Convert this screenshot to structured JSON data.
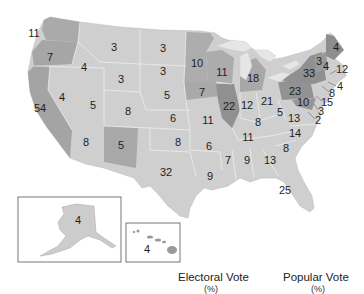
{
  "map": {
    "title": "",
    "colors": {
      "light": "#cfcfcf",
      "medium": "#a9a9a9",
      "dark": "#8f8f8f",
      "border": "#f2f2f2",
      "lakes": "#e6e6e6"
    },
    "states": [
      {
        "id": "WA",
        "value": "11",
        "x": 34,
        "y": 33,
        "shade": "medium"
      },
      {
        "id": "OR",
        "value": "7",
        "x": 50,
        "y": 57,
        "shade": "medium"
      },
      {
        "id": "CA",
        "value": "54",
        "x": 40,
        "y": 108,
        "shade": "medium"
      },
      {
        "id": "ID",
        "value": "4",
        "x": 84,
        "y": 67,
        "shade": "light"
      },
      {
        "id": "NV",
        "value": "4",
        "x": 62,
        "y": 97,
        "shade": "light"
      },
      {
        "id": "MT",
        "value": "3",
        "x": 114,
        "y": 47,
        "shade": "light"
      },
      {
        "id": "WY",
        "value": "3",
        "x": 121,
        "y": 79,
        "shade": "light"
      },
      {
        "id": "UT",
        "value": "5",
        "x": 93,
        "y": 105,
        "shade": "light"
      },
      {
        "id": "CO",
        "value": "8",
        "x": 128,
        "y": 111,
        "shade": "light"
      },
      {
        "id": "AZ",
        "value": "8",
        "x": 86,
        "y": 142,
        "shade": "light"
      },
      {
        "id": "NM",
        "value": "5",
        "x": 121,
        "y": 145,
        "shade": "medium"
      },
      {
        "id": "ND",
        "value": "3",
        "x": 163,
        "y": 48,
        "shade": "light"
      },
      {
        "id": "SD",
        "value": "3",
        "x": 163,
        "y": 71,
        "shade": "light"
      },
      {
        "id": "NE",
        "value": "5",
        "x": 167,
        "y": 95,
        "shade": "light"
      },
      {
        "id": "KS",
        "value": "6",
        "x": 173,
        "y": 118,
        "shade": "light"
      },
      {
        "id": "OK",
        "value": "8",
        "x": 178,
        "y": 142,
        "shade": "light"
      },
      {
        "id": "TX",
        "value": "32",
        "x": 166,
        "y": 172,
        "shade": "light"
      },
      {
        "id": "MN",
        "value": "10",
        "x": 197,
        "y": 63,
        "shade": "medium"
      },
      {
        "id": "IA",
        "value": "7",
        "x": 202,
        "y": 92,
        "shade": "medium"
      },
      {
        "id": "MO",
        "value": "11",
        "x": 208,
        "y": 120,
        "shade": "light"
      },
      {
        "id": "AR",
        "value": "6",
        "x": 209,
        "y": 146,
        "shade": "light"
      },
      {
        "id": "LA",
        "value": "9",
        "x": 210,
        "y": 176,
        "shade": "light"
      },
      {
        "id": "WI",
        "value": "11",
        "x": 222,
        "y": 72,
        "shade": "medium"
      },
      {
        "id": "IL",
        "value": "22",
        "x": 229,
        "y": 106,
        "shade": "dark"
      },
      {
        "id": "MS",
        "value": "7",
        "x": 228,
        "y": 160,
        "shade": "light"
      },
      {
        "id": "MI",
        "value": "18",
        "x": 253,
        "y": 78,
        "shade": "medium"
      },
      {
        "id": "IN",
        "value": "12",
        "x": 247,
        "y": 105,
        "shade": "light"
      },
      {
        "id": "KY",
        "value": "8",
        "x": 258,
        "y": 122,
        "shade": "light"
      },
      {
        "id": "TN",
        "value": "11",
        "x": 248,
        "y": 137,
        "shade": "light"
      },
      {
        "id": "AL",
        "value": "9",
        "x": 247,
        "y": 160,
        "shade": "light"
      },
      {
        "id": "OH",
        "value": "21",
        "x": 267,
        "y": 101,
        "shade": "light"
      },
      {
        "id": "GA",
        "value": "13",
        "x": 270,
        "y": 160,
        "shade": "light"
      },
      {
        "id": "FL",
        "value": "25",
        "x": 285,
        "y": 190,
        "shade": "light"
      },
      {
        "id": "WV",
        "value": "5",
        "x": 280,
        "y": 112,
        "shade": "light"
      },
      {
        "id": "VA",
        "value": "13",
        "x": 294,
        "y": 118,
        "shade": "light"
      },
      {
        "id": "NC",
        "value": "14",
        "x": 295,
        "y": 133,
        "shade": "light"
      },
      {
        "id": "SC",
        "value": "8",
        "x": 286,
        "y": 148,
        "shade": "light"
      },
      {
        "id": "PA",
        "value": "23",
        "x": 295,
        "y": 91,
        "shade": "dark"
      },
      {
        "id": "NY",
        "value": "33",
        "x": 309,
        "y": 73,
        "shade": "dark"
      },
      {
        "id": "VT",
        "value": "3",
        "x": 319,
        "y": 61,
        "shade": "dark"
      },
      {
        "id": "NH",
        "value": "4",
        "x": 326,
        "y": 66,
        "shade": "light"
      },
      {
        "id": "ME",
        "value": "4",
        "x": 336,
        "y": 47,
        "shade": "dark"
      },
      {
        "id": "MD",
        "value": "10",
        "x": 303,
        "y": 102,
        "shade": "dark"
      },
      {
        "id": "MA",
        "value": "12",
        "x": 342,
        "y": 69,
        "shade": "out"
      },
      {
        "id": "RI",
        "value": "4",
        "x": 340,
        "y": 86,
        "shade": "out"
      },
      {
        "id": "CT",
        "value": "8",
        "x": 332,
        "y": 93,
        "shade": "out"
      },
      {
        "id": "NJ",
        "value": "15",
        "x": 327,
        "y": 102,
        "shade": "out"
      },
      {
        "id": "DE",
        "value": "3",
        "x": 321,
        "y": 111,
        "shade": "out"
      },
      {
        "id": "DC",
        "value": "2",
        "x": 318,
        "y": 120,
        "shade": "out"
      },
      {
        "id": "AK",
        "value": "4",
        "x": 78,
        "y": 220,
        "shade": "light"
      },
      {
        "id": "HI",
        "value": "4",
        "x": 147,
        "y": 249,
        "shade": "light"
      }
    ]
  },
  "legend": {
    "electoral_label": "Electoral Vote",
    "electoral_unit": "(%)",
    "popular_label": "Popular Vote",
    "popular_unit": "(%)"
  }
}
